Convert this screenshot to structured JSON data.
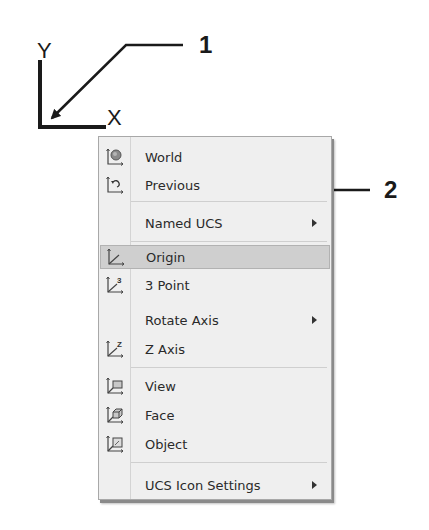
{
  "annotations": {
    "ucs_icon": {
      "y_label": "Y",
      "x_label": "X"
    },
    "callouts": [
      {
        "number": "1",
        "target": "ucs-icon-origin"
      },
      {
        "number": "2",
        "target": "menu-item-origin"
      }
    ]
  },
  "menu": {
    "items": [
      {
        "label": "World",
        "icon": "ucs-world-icon",
        "submenu": false,
        "highlighted": false
      },
      {
        "label": "Previous",
        "icon": "ucs-previous-icon",
        "submenu": false,
        "highlighted": false
      },
      {
        "label": "Named UCS",
        "icon": null,
        "submenu": true,
        "highlighted": false
      },
      {
        "label": "Origin",
        "icon": "ucs-origin-icon",
        "submenu": false,
        "highlighted": true
      },
      {
        "label": "3 Point",
        "icon": "ucs-3point-icon",
        "submenu": false,
        "highlighted": false
      },
      {
        "label": "Rotate Axis",
        "icon": null,
        "submenu": true,
        "highlighted": false
      },
      {
        "label": "Z Axis",
        "icon": "ucs-zaxis-icon",
        "submenu": false,
        "highlighted": false
      },
      {
        "label": "View",
        "icon": "ucs-view-icon",
        "submenu": false,
        "highlighted": false
      },
      {
        "label": "Face",
        "icon": "ucs-face-icon",
        "submenu": false,
        "highlighted": false
      },
      {
        "label": "Object",
        "icon": "ucs-object-icon",
        "submenu": false,
        "highlighted": false
      },
      {
        "label": "UCS Icon Settings",
        "icon": null,
        "submenu": true,
        "highlighted": false
      }
    ]
  },
  "colors": {
    "menu_bg": "#efefef",
    "highlight_bg": "#cfcfcf",
    "text": "#2a2a2a",
    "annotation": "#1a1a1a"
  }
}
